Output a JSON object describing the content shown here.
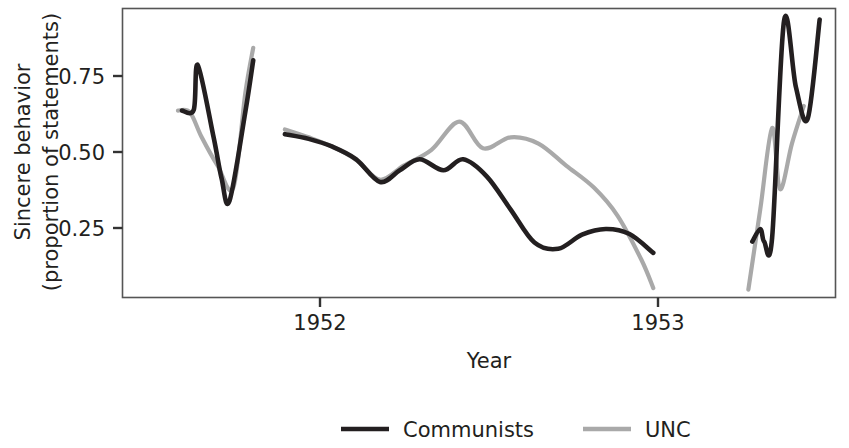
{
  "chart_data": {
    "type": "line",
    "title": "",
    "xlabel": "Year",
    "ylabel": "Sincere behavior\n(proportion of statements)",
    "ylabel_line1": "Sincere behavior",
    "ylabel_line2": "(proportion of statements)",
    "x_tick_labels": [
      "1952",
      "1953"
    ],
    "x_tick_values": [
      1952,
      1953
    ],
    "y_tick_labels": [
      "0.25",
      "0.50",
      "0.75"
    ],
    "y_tick_values": [
      0.25,
      0.5,
      0.75
    ],
    "ylim": [
      0.05,
      0.97
    ],
    "xlim": [
      1951.55,
      1953.35
    ],
    "grid": false,
    "legend_position": "bottom",
    "legend": [
      {
        "name": "Communists",
        "color": "#231f20"
      },
      {
        "name": "UNC",
        "color": "#a9a9a9"
      }
    ],
    "series": [
      {
        "name": "Communists",
        "color": "#231f20",
        "segments": [
          {
            "label": "early-1951-burst",
            "x": [
              1951.7,
              1951.73,
              1951.74,
              1951.78,
              1951.8,
              1951.82,
              1951.86,
              1951.88
            ],
            "y": [
              0.645,
              0.648,
              0.79,
              0.56,
              0.43,
              0.357,
              0.64,
              0.805
            ]
          },
          {
            "label": "1952-main",
            "x": [
              1951.96,
              1952.02,
              1952.08,
              1952.14,
              1952.2,
              1952.25,
              1952.3,
              1952.36,
              1952.41,
              1952.47,
              1952.53,
              1952.59,
              1952.65,
              1952.71,
              1952.77,
              1952.83,
              1952.89
            ],
            "y": [
              0.57,
              0.555,
              0.53,
              0.49,
              0.418,
              0.455,
              0.49,
              0.455,
              0.49,
              0.435,
              0.33,
              0.225,
              0.205,
              0.25,
              0.268,
              0.252,
              0.192
            ]
          },
          {
            "label": "1953-burst",
            "x": [
              1953.14,
              1953.16,
              1953.17,
              1953.19,
              1953.22,
              1953.25,
              1953.28,
              1953.31
            ],
            "y": [
              0.228,
              0.268,
              0.228,
              0.24,
              0.93,
              0.72,
              0.62,
              0.935
            ]
          }
        ]
      },
      {
        "name": "UNC",
        "color": "#a9a9a9",
        "segments": [
          {
            "label": "early-1951-burst",
            "x": [
              1951.69,
              1951.72,
              1951.75,
              1951.79,
              1951.83,
              1951.86,
              1951.88
            ],
            "y": [
              0.645,
              0.64,
              0.56,
              0.47,
              0.4,
              0.7,
              0.845
            ]
          },
          {
            "label": "1952-main",
            "x": [
              1951.96,
              1952.02,
              1952.08,
              1952.14,
              1952.2,
              1952.26,
              1952.33,
              1952.4,
              1952.46,
              1952.53,
              1952.6,
              1952.67,
              1952.74,
              1952.8,
              1952.86,
              1952.89
            ],
            "y": [
              0.585,
              0.56,
              0.53,
              0.488,
              0.425,
              0.47,
              0.52,
              0.61,
              0.525,
              0.56,
              0.54,
              0.47,
              0.4,
              0.31,
              0.17,
              0.08
            ]
          },
          {
            "label": "1953-burst",
            "x": [
              1953.13,
              1953.16,
              1953.19,
              1953.21,
              1953.24,
              1953.27
            ],
            "y": [
              0.075,
              0.33,
              0.59,
              0.395,
              0.54,
              0.66
            ]
          }
        ]
      }
    ]
  },
  "axes": {
    "x_title": "Year",
    "y_title_line1": "Sincere behavior",
    "y_title_line2": "(proportion of statements)",
    "y_ticks": [
      {
        "label": "0.75"
      },
      {
        "label": "0.50"
      },
      {
        "label": "0.25"
      }
    ],
    "x_ticks": [
      {
        "label": "1952"
      },
      {
        "label": "1953"
      }
    ]
  },
  "legend": {
    "items": [
      {
        "label": "Communists",
        "color": "#231f20"
      },
      {
        "label": "UNC",
        "color": "#a9a9a9"
      }
    ]
  },
  "style": {
    "frame_color": "#555555",
    "background": "#ffffff",
    "communists_color": "#231f20",
    "unc_color": "#a9a9a9"
  }
}
